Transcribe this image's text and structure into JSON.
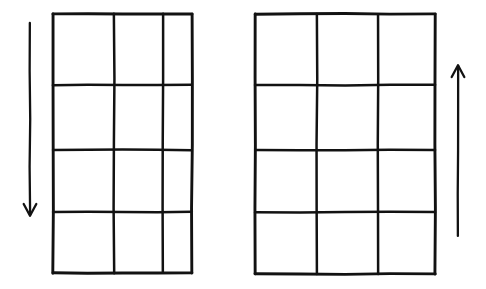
{
  "figure": {
    "title": "Two 3x4 grids with opposing vertical direction arrows",
    "background_color": "#ffffff",
    "ink_color": "#121212",
    "style": "hand-drawn",
    "width": 486,
    "height": 289
  },
  "grids": [
    {
      "id": "left-grid",
      "name": "left-grid",
      "columns": 3,
      "rows": 4,
      "x_lines": [
        53,
        114,
        163,
        192
      ],
      "y_lines": [
        14,
        85,
        150,
        212,
        273
      ],
      "cells": [
        {
          "row": 1,
          "col": 1,
          "label": ""
        },
        {
          "row": 1,
          "col": 2,
          "label": ""
        },
        {
          "row": 1,
          "col": 3,
          "label": ""
        },
        {
          "row": 2,
          "col": 1,
          "label": ""
        },
        {
          "row": 2,
          "col": 2,
          "label": ""
        },
        {
          "row": 2,
          "col": 3,
          "label": ""
        },
        {
          "row": 3,
          "col": 1,
          "label": ""
        },
        {
          "row": 3,
          "col": 2,
          "label": ""
        },
        {
          "row": 3,
          "col": 3,
          "label": ""
        },
        {
          "row": 4,
          "col": 1,
          "label": ""
        },
        {
          "row": 4,
          "col": 2,
          "label": ""
        },
        {
          "row": 4,
          "col": 3,
          "label": ""
        }
      ]
    },
    {
      "id": "right-grid",
      "name": "right-grid",
      "columns": 3,
      "rows": 4,
      "x_lines": [
        255,
        317,
        378,
        435
      ],
      "y_lines": [
        14,
        85,
        150,
        212,
        274
      ],
      "cells": [
        {
          "row": 1,
          "col": 1,
          "label": ""
        },
        {
          "row": 1,
          "col": 2,
          "label": ""
        },
        {
          "row": 1,
          "col": 3,
          "label": ""
        },
        {
          "row": 2,
          "col": 1,
          "label": ""
        },
        {
          "row": 2,
          "col": 2,
          "label": ""
        },
        {
          "row": 2,
          "col": 3,
          "label": ""
        },
        {
          "row": 3,
          "col": 1,
          "label": ""
        },
        {
          "row": 3,
          "col": 2,
          "label": ""
        },
        {
          "row": 3,
          "col": 3,
          "label": ""
        },
        {
          "row": 4,
          "col": 1,
          "label": ""
        },
        {
          "row": 4,
          "col": 2,
          "label": ""
        },
        {
          "row": 4,
          "col": 3,
          "label": ""
        }
      ]
    }
  ],
  "arrows": [
    {
      "id": "left-arrow",
      "name": "down-arrow",
      "direction": "down",
      "x": 30,
      "y_start": 23,
      "y_end": 215,
      "label": ""
    },
    {
      "id": "right-arrow",
      "name": "up-arrow",
      "direction": "up",
      "x": 458,
      "y_start": 236,
      "y_end": 66,
      "label": ""
    }
  ],
  "labels": {
    "none_visible": ""
  }
}
